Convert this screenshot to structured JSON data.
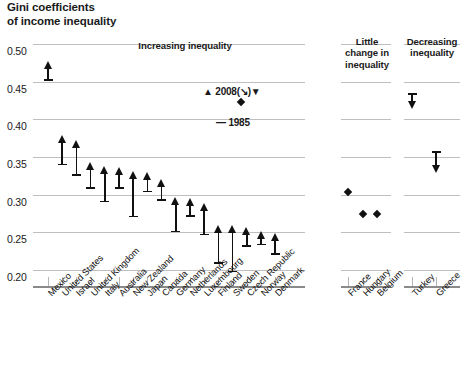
{
  "title": "Gini coefficients\nof income inequality",
  "legend": {
    "top": "▲ 2008(↘)▼",
    "bottom": "— 1985"
  },
  "sections": [
    {
      "name": "increasing",
      "label": "Increasing inequality"
    },
    {
      "name": "little-change",
      "label": "Little\nchange in\ninequality"
    },
    {
      "name": "decreasing",
      "label": "Decreasing\ninequality"
    }
  ],
  "yticks": [
    "0.50",
    "0.45",
    "0.40",
    "0.35",
    "0.30",
    "0.25",
    "0.20"
  ],
  "chart_data": {
    "type": "bar",
    "title": "Gini coefficients of income inequality",
    "xlabel": "",
    "ylabel": "Gini coefficient",
    "ylim": [
      0.2,
      0.5
    ],
    "grid": true,
    "legend_position": "inside-top-right",
    "series": [
      {
        "name": "1985",
        "note": "base of arrow (dash marker)"
      },
      {
        "name": "2008",
        "note": "head of arrow (triangle marker)"
      }
    ],
    "categories": [
      "Mexico",
      "United States",
      "Israel",
      "United Kingdom",
      "Italy",
      "Australia",
      "New Zealand",
      "Japan",
      "Canada",
      "Germany",
      "Netherlands",
      "Luxembourg",
      "Finland",
      "Sweden",
      "Czech Republic",
      "Norway",
      "Denmark",
      "France",
      "Hungary",
      "Belgium",
      "Turkey",
      "Greece"
    ],
    "groups": {
      "increasing": [
        "Mexico",
        "United States",
        "Israel",
        "United Kingdom",
        "Italy",
        "Australia",
        "New Zealand",
        "Japan",
        "Canada",
        "Germany",
        "Netherlands",
        "Luxembourg",
        "Finland",
        "Sweden",
        "Czech Republic",
        "Norway",
        "Denmark"
      ],
      "little_change": [
        "France",
        "Hungary",
        "Belgium"
      ],
      "decreasing": [
        "Turkey",
        "Greece"
      ]
    },
    "points": [
      {
        "country": "Mexico",
        "v1985": 0.452,
        "v2008": 0.476,
        "direction": "up"
      },
      {
        "country": "United States",
        "v1985": 0.34,
        "v2008": 0.378,
        "direction": "up"
      },
      {
        "country": "Israel",
        "v1985": 0.326,
        "v2008": 0.371,
        "direction": "up"
      },
      {
        "country": "United Kingdom",
        "v1985": 0.309,
        "v2008": 0.342,
        "direction": "up"
      },
      {
        "country": "Italy",
        "v1985": 0.291,
        "v2008": 0.337,
        "direction": "up"
      },
      {
        "country": "Australia",
        "v1985": 0.309,
        "v2008": 0.336,
        "direction": "up"
      },
      {
        "country": "New Zealand",
        "v1985": 0.271,
        "v2008": 0.33,
        "direction": "up"
      },
      {
        "country": "Japan",
        "v1985": 0.304,
        "v2008": 0.329,
        "direction": "up"
      },
      {
        "country": "Canada",
        "v1985": 0.293,
        "v2008": 0.32,
        "direction": "up"
      },
      {
        "country": "Germany",
        "v1985": 0.251,
        "v2008": 0.295,
        "direction": "up"
      },
      {
        "country": "Netherlands",
        "v1985": 0.272,
        "v2008": 0.294,
        "direction": "up"
      },
      {
        "country": "Luxembourg",
        "v1985": 0.247,
        "v2008": 0.288,
        "direction": "up"
      },
      {
        "country": "Finland",
        "v1985": 0.209,
        "v2008": 0.259,
        "direction": "up"
      },
      {
        "country": "Sweden",
        "v1985": 0.198,
        "v2008": 0.259,
        "direction": "up"
      },
      {
        "country": "Czech Republic",
        "v1985": 0.232,
        "v2008": 0.256,
        "direction": "up"
      },
      {
        "country": "Norway",
        "v1985": 0.234,
        "v2008": 0.25,
        "direction": "up"
      },
      {
        "country": "Denmark",
        "v1985": 0.221,
        "v2008": 0.248,
        "direction": "up"
      },
      {
        "country": "France",
        "v1985": 0.3,
        "v2008": 0.303,
        "direction": "flat"
      },
      {
        "country": "Hungary",
        "v1985": 0.273,
        "v2008": 0.274,
        "direction": "flat"
      },
      {
        "country": "Belgium",
        "v1985": 0.274,
        "v2008": 0.275,
        "direction": "flat"
      },
      {
        "country": "Turkey",
        "v1985": 0.434,
        "v2008": 0.415,
        "direction": "down"
      },
      {
        "country": "Greece",
        "v1985": 0.357,
        "v2008": 0.33,
        "direction": "down"
      }
    ]
  }
}
